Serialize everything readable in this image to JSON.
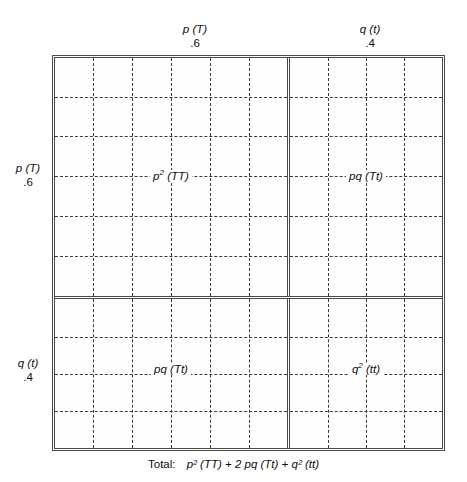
{
  "columns": [
    {
      "id": "p",
      "symbol": "p (T)",
      "frequency": ".6"
    },
    {
      "id": "q",
      "symbol": "q (t)",
      "frequency": ".4"
    }
  ],
  "rows": [
    {
      "id": "p",
      "symbol": "p (T)",
      "frequency": ".6"
    },
    {
      "id": "q",
      "symbol": "q (t)",
      "frequency": ".4"
    }
  ],
  "cells": {
    "top_left": {
      "coefficient": "p",
      "exponent": "2",
      "genotype": "(TT)",
      "label": "p² (TT)"
    },
    "top_right": {
      "coefficient": "pq",
      "exponent": "",
      "genotype": "(Tt)",
      "label": "pq (Tt)"
    },
    "bottom_left": {
      "coefficient": "pq",
      "exponent": "",
      "genotype": "(Tt)",
      "label": "pq (Tt)"
    },
    "bottom_right": {
      "coefficient": "q",
      "exponent": "2",
      "genotype": "(tt)",
      "label": "q² (tt)"
    }
  },
  "total": {
    "label": "Total:",
    "expression": "p² (TT) + 2 pq (Tt) + q² (tt)"
  },
  "grid": {
    "top_left": {
      "cols": 6,
      "rows": 6
    },
    "top_right": {
      "cols": 4,
      "rows": 6
    },
    "bottom_left": {
      "cols": 6,
      "rows": 4
    },
    "bottom_right": {
      "cols": 4,
      "rows": 4
    }
  },
  "colors": {
    "frame": "#4a4a4a",
    "grid": "#3a3a3a",
    "background": "#ffffff",
    "text": "#0d0d0d"
  }
}
